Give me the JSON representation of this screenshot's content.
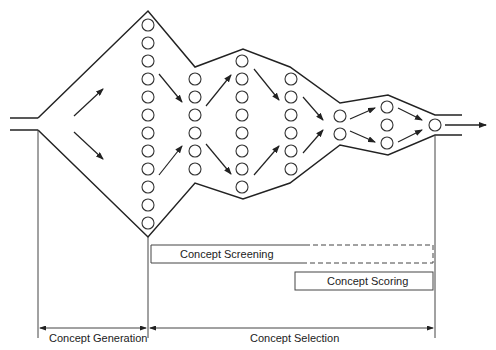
{
  "colors": {
    "line": "#222222",
    "background": "#ffffff"
  },
  "funnel": {
    "columns": [
      {
        "x": 148,
        "count": 12,
        "y_start": 25
      },
      {
        "x": 195,
        "count": 6,
        "y_start": 79
      },
      {
        "x": 242,
        "count": 8,
        "y_start": 61
      },
      {
        "x": 291,
        "count": 6,
        "y_start": 79
      },
      {
        "x": 340,
        "count": 2,
        "y_start": 116
      },
      {
        "x": 387,
        "count": 3,
        "y_start": 107
      },
      {
        "x": 435,
        "count": 1,
        "y_start": 125
      }
    ],
    "circle_spacing": 18,
    "circle_radius": 6
  },
  "bars": {
    "screening": {
      "label": "Concept Screening"
    },
    "scoring": {
      "label": "Concept Scoring"
    }
  },
  "phases": {
    "generation": {
      "label": "Concept Generation"
    },
    "selection": {
      "label": "Concept Selection"
    }
  }
}
